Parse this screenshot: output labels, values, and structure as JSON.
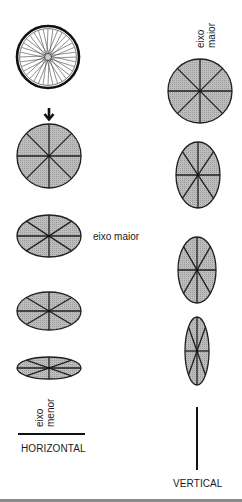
{
  "figure": {
    "colors": {
      "ellipse_fill": "#b3b3b3",
      "stroke": "#1f1f1f",
      "background": "#ffffff",
      "bottom_rule": "#8a8a8a"
    },
    "left_column": {
      "wheel": {
        "cx": 48,
        "cy": 57,
        "r": 31,
        "icon": "bicycle-wheel-icon"
      },
      "arrow": {
        "icon": "down-arrow-icon",
        "cx": 49,
        "cy": 114
      },
      "ellipses": [
        {
          "cx": 49,
          "cy": 156,
          "rx": 32,
          "ry": 32
        },
        {
          "cx": 49,
          "cy": 236,
          "rx": 32,
          "ry": 21
        },
        {
          "cx": 49,
          "cy": 311,
          "rx": 32,
          "ry": 19
        },
        {
          "cx": 49,
          "cy": 368,
          "rx": 32,
          "ry": 11
        }
      ],
      "major_axis_label": "eixo maior",
      "minor_axis_label_line1": "eixo",
      "minor_axis_label_line2": "menor",
      "line_label": "HORIZONTAL"
    },
    "right_column": {
      "major_axis_label_line1": "eixo",
      "major_axis_label_line2": "maior",
      "ellipses": [
        {
          "cx": 200,
          "cy": 91,
          "rx": 32,
          "ry": 32
        },
        {
          "cx": 198,
          "cy": 175,
          "rx": 22,
          "ry": 33
        },
        {
          "cx": 197,
          "cy": 270,
          "rx": 19,
          "ry": 33
        },
        {
          "cx": 197,
          "cy": 351,
          "rx": 12,
          "ry": 34
        }
      ],
      "line_label": "VERTICAL"
    }
  }
}
